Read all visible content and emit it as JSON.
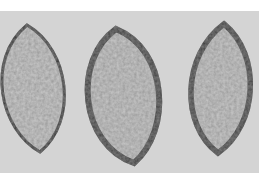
{
  "image": {
    "description": "Grayscale photograph of three lens-shaped (vesica) outlines with dark mottled borders on a light gray background",
    "caption": "",
    "colors": {
      "margin": "#ffffff",
      "background": "#d4d4d4",
      "interior": "#c5c5c5",
      "border": "#3c3c3c",
      "border_mottle": "#6a6a6a"
    },
    "shapes": [
      {
        "id": "lens-1",
        "top_tip": [
          27,
          25
        ],
        "bottom_tip": [
          40,
          152
        ],
        "left_extent": -10,
        "right_extent": 66,
        "clipped": "left"
      },
      {
        "id": "lens-2",
        "top_tip": [
          116,
          29
        ],
        "bottom_tip": [
          134,
          163
        ],
        "left_extent": 85,
        "right_extent": 161
      },
      {
        "id": "lens-3",
        "top_tip": [
          224,
          24
        ],
        "bottom_tip": [
          218,
          153
        ],
        "left_extent": 187,
        "right_extent": 251
      }
    ]
  }
}
